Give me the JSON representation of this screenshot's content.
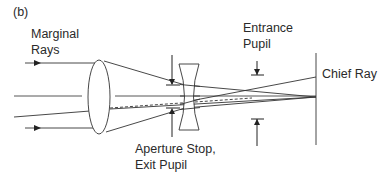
{
  "figure": {
    "panel_label": "(b)",
    "labels": {
      "marginal_rays_line1": "Marginal",
      "marginal_rays_line2": "Rays",
      "entrance_pupil_line1": "Entrance",
      "entrance_pupil_line2": "Pupil",
      "chief_ray": "Chief Ray",
      "aperture_stop_line1": "Aperture Stop,",
      "aperture_stop_line2": "Exit Pupil"
    },
    "elements": [
      "convex-lens",
      "concave-lens",
      "aperture-stop",
      "entrance-pupil-markers",
      "image-plane",
      "optical-axis",
      "marginal-rays",
      "chief-ray"
    ],
    "colors": {
      "line": "#333333",
      "text": "#2a2a2a",
      "background": "#ffffff"
    }
  }
}
